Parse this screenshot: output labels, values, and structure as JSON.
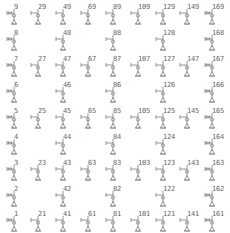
{
  "grid": {
    "columns": 9,
    "rows": 9,
    "col_x": [
      5,
      29,
      54,
      79,
      104,
      129,
      154,
      178,
      203
    ],
    "row_y": [
      4,
      30,
      56,
      82,
      108,
      134,
      160,
      186,
      211
    ],
    "glyph_color": "#8a8a8a",
    "label_color": "#666666"
  },
  "cells": [
    {
      "row": 0,
      "col": 0,
      "label": "9",
      "style": "dense"
    },
    {
      "row": 0,
      "col": 1,
      "label": "29",
      "style": "open"
    },
    {
      "row": 0,
      "col": 2,
      "label": "49",
      "style": "open"
    },
    {
      "row": 0,
      "col": 3,
      "label": "69",
      "style": "open"
    },
    {
      "row": 0,
      "col": 4,
      "label": "89",
      "style": "open"
    },
    {
      "row": 0,
      "col": 5,
      "label": "109",
      "style": "open"
    },
    {
      "row": 0,
      "col": 6,
      "label": "129",
      "style": "open"
    },
    {
      "row": 0,
      "col": 7,
      "label": "149",
      "style": "open"
    },
    {
      "row": 0,
      "col": 8,
      "label": "169",
      "style": "dense"
    },
    {
      "row": 1,
      "col": 0,
      "label": "8",
      "style": "dense"
    },
    {
      "row": 1,
      "col": 2,
      "label": "48",
      "style": "open"
    },
    {
      "row": 1,
      "col": 4,
      "label": "88",
      "style": "open"
    },
    {
      "row": 1,
      "col": 6,
      "label": "128",
      "style": "open"
    },
    {
      "row": 1,
      "col": 8,
      "label": "168",
      "style": "dense"
    },
    {
      "row": 2,
      "col": 0,
      "label": "7",
      "style": "dense"
    },
    {
      "row": 2,
      "col": 1,
      "label": "27",
      "style": "open"
    },
    {
      "row": 2,
      "col": 2,
      "label": "47",
      "style": "open"
    },
    {
      "row": 2,
      "col": 3,
      "label": "67",
      "style": "open"
    },
    {
      "row": 2,
      "col": 4,
      "label": "87",
      "style": "open"
    },
    {
      "row": 2,
      "col": 5,
      "label": "107",
      "style": "open"
    },
    {
      "row": 2,
      "col": 6,
      "label": "127",
      "style": "open"
    },
    {
      "row": 2,
      "col": 7,
      "label": "147",
      "style": "open"
    },
    {
      "row": 2,
      "col": 8,
      "label": "167",
      "style": "dense"
    },
    {
      "row": 3,
      "col": 0,
      "label": "6",
      "style": "dense"
    },
    {
      "row": 3,
      "col": 2,
      "label": "46",
      "style": "open"
    },
    {
      "row": 3,
      "col": 4,
      "label": "86",
      "style": "open"
    },
    {
      "row": 3,
      "col": 6,
      "label": "126",
      "style": "open"
    },
    {
      "row": 3,
      "col": 8,
      "label": "166",
      "style": "dense"
    },
    {
      "row": 4,
      "col": 0,
      "label": "5",
      "style": "dense"
    },
    {
      "row": 4,
      "col": 1,
      "label": "25",
      "style": "open"
    },
    {
      "row": 4,
      "col": 2,
      "label": "45",
      "style": "open"
    },
    {
      "row": 4,
      "col": 3,
      "label": "65",
      "style": "open"
    },
    {
      "row": 4,
      "col": 4,
      "label": "85",
      "style": "open"
    },
    {
      "row": 4,
      "col": 5,
      "label": "105",
      "style": "open"
    },
    {
      "row": 4,
      "col": 6,
      "label": "125",
      "style": "open"
    },
    {
      "row": 4,
      "col": 7,
      "label": "145",
      "style": "open"
    },
    {
      "row": 4,
      "col": 8,
      "label": "165",
      "style": "dense"
    },
    {
      "row": 5,
      "col": 0,
      "label": "4",
      "style": "dense"
    },
    {
      "row": 5,
      "col": 2,
      "label": "44",
      "style": "open"
    },
    {
      "row": 5,
      "col": 4,
      "label": "84",
      "style": "open"
    },
    {
      "row": 5,
      "col": 6,
      "label": "124",
      "style": "open"
    },
    {
      "row": 5,
      "col": 8,
      "label": "164",
      "style": "dense"
    },
    {
      "row": 6,
      "col": 0,
      "label": "3",
      "style": "dense"
    },
    {
      "row": 6,
      "col": 1,
      "label": "23",
      "style": "open"
    },
    {
      "row": 6,
      "col": 2,
      "label": "43",
      "style": "open"
    },
    {
      "row": 6,
      "col": 3,
      "label": "63",
      "style": "open"
    },
    {
      "row": 6,
      "col": 4,
      "label": "83",
      "style": "open"
    },
    {
      "row": 6,
      "col": 5,
      "label": "103",
      "style": "open"
    },
    {
      "row": 6,
      "col": 6,
      "label": "123",
      "style": "open"
    },
    {
      "row": 6,
      "col": 7,
      "label": "143",
      "style": "open"
    },
    {
      "row": 6,
      "col": 8,
      "label": "163",
      "style": "dense"
    },
    {
      "row": 7,
      "col": 0,
      "label": "2",
      "style": "dense"
    },
    {
      "row": 7,
      "col": 2,
      "label": "42",
      "style": "open"
    },
    {
      "row": 7,
      "col": 4,
      "label": "82",
      "style": "open"
    },
    {
      "row": 7,
      "col": 6,
      "label": "122",
      "style": "open"
    },
    {
      "row": 7,
      "col": 8,
      "label": "162",
      "style": "dense"
    },
    {
      "row": 8,
      "col": 0,
      "label": "1",
      "style": "dense"
    },
    {
      "row": 8,
      "col": 1,
      "label": "21",
      "style": "open"
    },
    {
      "row": 8,
      "col": 2,
      "label": "41",
      "style": "open"
    },
    {
      "row": 8,
      "col": 3,
      "label": "61",
      "style": "open"
    },
    {
      "row": 8,
      "col": 4,
      "label": "81",
      "style": "open"
    },
    {
      "row": 8,
      "col": 5,
      "label": "101",
      "style": "open"
    },
    {
      "row": 8,
      "col": 6,
      "label": "121",
      "style": "open"
    },
    {
      "row": 8,
      "col": 7,
      "label": "141",
      "style": "open"
    },
    {
      "row": 8,
      "col": 8,
      "label": "161",
      "style": "dense"
    }
  ]
}
